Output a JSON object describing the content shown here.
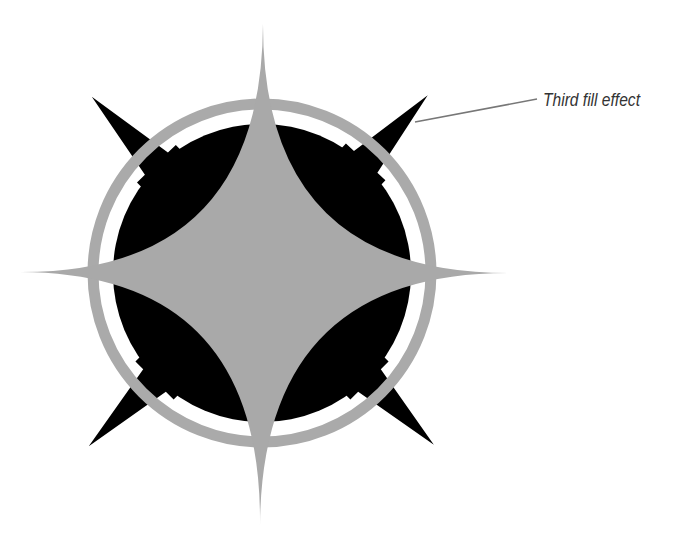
{
  "diagram": {
    "annotation": {
      "label": "Third fill effect",
      "color": "#333333",
      "leader_line_color": "#777777"
    },
    "colors": {
      "background": "#ffffff",
      "star_fill": "#a9a9a9",
      "ring_stroke": "#aaaaaa",
      "disc_fill": "#000000",
      "spike_fill": "#000000"
    },
    "shapes": [
      {
        "name": "four-point-star",
        "fill": "gray"
      },
      {
        "name": "outer-ring",
        "stroke": "gray"
      },
      {
        "name": "black-disc",
        "fill": "black"
      },
      {
        "name": "diagonal-spikes",
        "count": 4,
        "fill": "black"
      }
    ]
  }
}
